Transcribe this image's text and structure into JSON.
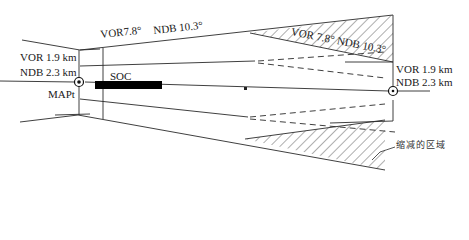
{
  "diagram": {
    "type": "approach obstacle-protection area (missed approach segment)",
    "labels": {
      "top_splay": "VOR7.8°   NDB 10.3°",
      "top_splay_vor": "VOR7.8°",
      "top_splay_ndb": "NDB 10.3°",
      "reduced_splay": "VOR 7.8° NDB 10.3°",
      "left_vor_width": "VOR 1.9 km",
      "left_ndb_width": "NDB 2.3 km",
      "right_vor_width": "VOR 1.9 km",
      "right_ndb_width": "NDB 2.3 km",
      "soc": "SOC",
      "mapt": "MAPt",
      "reduced_area": "缩减的区域"
    },
    "elements": {
      "left_fix": "MAPt navaid symbol (circle with dot)",
      "right_fix": "navaid symbol (circle with dot)",
      "soc_bar": "SOC (start of climb) segment bar",
      "hatched_areas": [
        "upper reduced area",
        "lower reduced area"
      ]
    },
    "colors": {
      "line": "#2a2a2a",
      "hatch": "#333333",
      "bar": "#000000",
      "background": "#ffffff"
    }
  }
}
